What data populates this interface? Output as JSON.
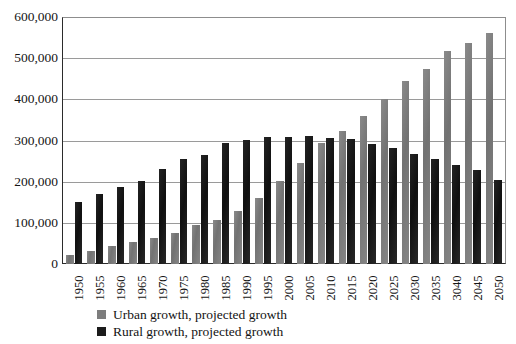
{
  "chart_data": {
    "type": "bar",
    "title": "",
    "subtitle": "",
    "xlabel": "",
    "ylabel": "",
    "ylim": [
      0,
      600000
    ],
    "ytick_step": 100000,
    "grid": true,
    "legend_position": "bottom-left",
    "orientation": "vertical",
    "grouping": "grouped",
    "categories": [
      "1950",
      "1955",
      "1960",
      "1965",
      "1970",
      "1975",
      "1980",
      "1985",
      "1990",
      "1995",
      "2000",
      "2005",
      "2010",
      "2015",
      "2020",
      "2025",
      "2030",
      "2035",
      "3040",
      "2045",
      "2050"
    ],
    "ytick_labels": [
      "600,000",
      "500,000",
      "400,000",
      "300,000",
      "200,000",
      "100,000",
      "0"
    ],
    "ytick_values": [
      600000,
      500000,
      400000,
      300000,
      200000,
      100000,
      0
    ],
    "series": [
      {
        "name": "Urban growth, projected growth",
        "color": "#7d7d7d",
        "values": [
          22000,
          31000,
          43000,
          53000,
          64000,
          76000,
          94000,
          108000,
          129000,
          161000,
          202000,
          246000,
          295000,
          324000,
          359000,
          401000,
          445000,
          473000,
          517000,
          537000,
          560000
        ]
      },
      {
        "name": "Rural growth, projected growth",
        "color": "#1c1c1c",
        "values": [
          151000,
          170000,
          187000,
          201000,
          230000,
          255000,
          264000,
          293000,
          302000,
          308000,
          308000,
          310000,
          306000,
          303000,
          292000,
          283000,
          268000,
          256000,
          240000,
          228000,
          205000
        ]
      }
    ]
  },
  "legend": {
    "items": [
      {
        "label": "Urban growth, projected growth",
        "swatch": "urban"
      },
      {
        "label": "Rural growth, projected growth",
        "swatch": "rural"
      }
    ]
  }
}
